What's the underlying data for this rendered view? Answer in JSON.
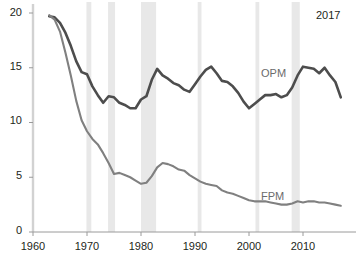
{
  "chart_data": {
    "type": "line",
    "title": "",
    "subtitle": "",
    "xlabel": "",
    "ylabel": "",
    "xlim": [
      1960,
      2017
    ],
    "ylim": [
      0,
      20
    ],
    "grid": false,
    "legend_position": "inline-annotation",
    "y_ticks": [
      0,
      5,
      10,
      15,
      20
    ],
    "y_tick_labels": [
      "0",
      "5",
      "10",
      "15",
      "20"
    ],
    "x_ticks": [
      1960,
      1970,
      1980,
      1990,
      2000,
      2010
    ],
    "x_tick_labels": [
      "1960",
      "1970",
      "1980",
      "1990",
      "2000",
      "2010"
    ],
    "annotations": [
      {
        "text": "2017",
        "x": 2016,
        "y": 19.3,
        "role": "end-year-label"
      },
      {
        "text": "OPM",
        "x": 2002,
        "y": 13.6,
        "role": "series-label"
      },
      {
        "text": "FPM",
        "x": 2002,
        "y": 4.2,
        "role": "series-label"
      }
    ],
    "shaded_bands": [
      {
        "label": "1969-1970",
        "start": 1969.9,
        "end": 1970.8
      },
      {
        "label": "1973-1975",
        "start": 1973.9,
        "end": 1975.2
      },
      {
        "label": "1980-1982",
        "start": 1980.0,
        "end": 1982.8
      },
      {
        "label": "1990-1991",
        "start": 1990.5,
        "end": 1991.2
      },
      {
        "label": "2001",
        "start": 2001.2,
        "end": 2001.9
      },
      {
        "label": "2007-2009",
        "start": 2007.9,
        "end": 2009.4
      }
    ],
    "series": [
      {
        "name": "OPM",
        "color": "#4d4d4d",
        "x": [
          1963,
          1964,
          1965,
          1966,
          1967,
          1968,
          1969,
          1970,
          1971,
          1972,
          1973,
          1974,
          1975,
          1976,
          1977,
          1978,
          1979,
          1980,
          1981,
          1982,
          1983,
          1984,
          1985,
          1986,
          1987,
          1988,
          1989,
          1990,
          1991,
          1992,
          1993,
          1994,
          1995,
          1996,
          1997,
          1998,
          1999,
          2000,
          2001,
          2002,
          2003,
          2004,
          2005,
          2006,
          2007,
          2008,
          2009,
          2010,
          2011,
          2012,
          2013,
          2014,
          2015,
          2016,
          2017
        ],
        "values": [
          19.7,
          19.6,
          19.1,
          18.2,
          17.0,
          15.6,
          14.6,
          14.4,
          13.3,
          12.5,
          11.8,
          12.4,
          12.3,
          11.8,
          11.6,
          11.3,
          11.3,
          12.1,
          12.4,
          13.9,
          14.9,
          14.3,
          14.0,
          13.6,
          13.4,
          13.0,
          12.8,
          13.5,
          14.2,
          14.8,
          15.1,
          14.5,
          13.8,
          13.7,
          13.3,
          12.7,
          11.9,
          11.3,
          11.7,
          12.1,
          12.5,
          12.5,
          12.6,
          12.3,
          12.5,
          13.2,
          14.3,
          15.1,
          15.0,
          14.9,
          14.5,
          15.0,
          14.3,
          13.7,
          12.3
        ]
      },
      {
        "name": "FPM",
        "color": "#808080",
        "x": [
          1963,
          1964,
          1965,
          1966,
          1967,
          1968,
          1969,
          1970,
          1971,
          1972,
          1973,
          1974,
          1975,
          1976,
          1977,
          1978,
          1979,
          1980,
          1981,
          1982,
          1983,
          1984,
          1985,
          1986,
          1987,
          1988,
          1989,
          1990,
          1991,
          1992,
          1993,
          1994,
          1995,
          1996,
          1997,
          1998,
          1999,
          2000,
          2001,
          2002,
          2003,
          2004,
          2005,
          2006,
          2007,
          2008,
          2009,
          2010,
          2011,
          2012,
          2013,
          2014,
          2015,
          2016,
          2017
        ],
        "values": [
          19.8,
          19.4,
          18.3,
          16.4,
          14.3,
          12.0,
          10.2,
          9.2,
          8.5,
          8.0,
          7.2,
          6.3,
          5.3,
          5.4,
          5.2,
          5.0,
          4.7,
          4.4,
          4.5,
          5.1,
          5.9,
          6.3,
          6.2,
          6.0,
          5.7,
          5.6,
          5.2,
          4.9,
          4.6,
          4.4,
          4.3,
          4.2,
          3.8,
          3.6,
          3.5,
          3.3,
          3.1,
          2.9,
          2.8,
          2.8,
          2.8,
          2.7,
          2.6,
          2.5,
          2.5,
          2.6,
          2.8,
          2.7,
          2.8,
          2.8,
          2.7,
          2.7,
          2.6,
          2.5,
          2.4
        ]
      }
    ]
  },
  "style": {
    "axis_color": "#9a9a9a",
    "band_color": "#e8e8e8",
    "text_color": "#231f20",
    "label_color": "#6b6b6b"
  }
}
